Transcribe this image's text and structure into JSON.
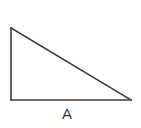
{
  "figure": {
    "kind": "right-triangle-diagram",
    "background_color": "#ffffff",
    "stroke_color": "#3b3b3b",
    "stroke_width": 1.6,
    "canvas": {
      "width": 141,
      "height": 128
    },
    "vertices": {
      "top_left": {
        "x": 11,
        "y": 28
      },
      "bottom_left": {
        "x": 11,
        "y": 100
      },
      "bottom_right": {
        "x": 131,
        "y": 100
      }
    },
    "sides": {
      "vertical_leg": {
        "from": "top_left",
        "to": "bottom_left",
        "length_px": 72
      },
      "horizontal_leg": {
        "from": "bottom_left",
        "to": "bottom_right",
        "length_px": 120
      },
      "hypotenuse": {
        "from": "top_left",
        "to": "bottom_right"
      }
    },
    "right_angle_at": "bottom_left",
    "labels": [
      {
        "id": "base",
        "text": "A",
        "color": "#3b3b3b",
        "font_size_px": 15,
        "position": {
          "x": 62,
          "y": 106
        },
        "labels_side": "horizontal_leg"
      }
    ]
  }
}
